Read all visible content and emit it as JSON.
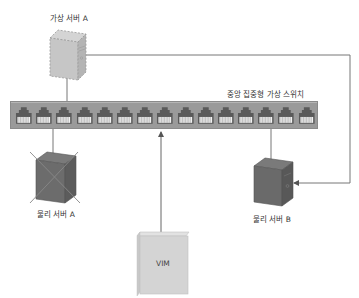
{
  "diagram": {
    "title": "",
    "nodes": {
      "virtual_server_a": {
        "label": "가상 서버 A",
        "style": "dashed",
        "color": "#c8c8c8"
      },
      "switch": {
        "label": "중앙 집중형 가상 스위치",
        "port_count": 15,
        "color": "#9a9a9a"
      },
      "physical_server_a": {
        "label": "물리 서버 A",
        "status": "crossed-out",
        "color": "#6f6f6f"
      },
      "physical_server_b": {
        "label": "물리 서버 B",
        "color": "#6f6f6f"
      },
      "vim": {
        "label": "VIM",
        "color": "#d6d6d6"
      }
    },
    "edges": [
      {
        "from": "virtual_server_a",
        "to": "switch",
        "type": "line"
      },
      {
        "from": "physical_server_a",
        "to": "switch",
        "type": "line"
      },
      {
        "from": "physical_server_b",
        "to": "switch",
        "type": "line"
      },
      {
        "from": "vim",
        "to": "switch",
        "type": "arrow"
      },
      {
        "from": "virtual_server_a",
        "to": "physical_server_b",
        "type": "arrow",
        "meaning": "migration"
      }
    ]
  }
}
